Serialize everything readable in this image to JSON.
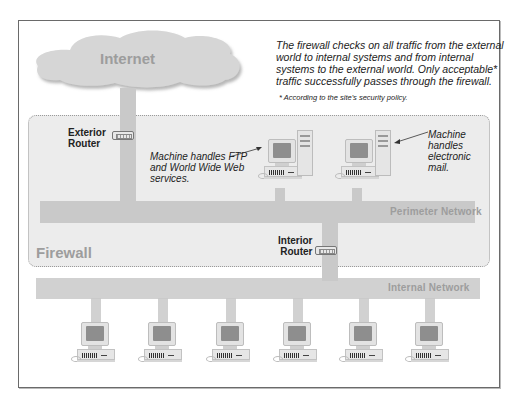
{
  "diagram": {
    "cloud_label": "Internet",
    "description": "The firewall checks on all traffic from the external world to internal systems and from internal systems to the external world. Only acceptable* traffic successfully passes through the firewall.",
    "description_lines": [
      "The firewall checks on all traffic from the external",
      "world to internal systems and from internal",
      "systems to the external world. Only acceptable*",
      "traffic successfully passes through the firewall."
    ],
    "footnote": "* According to the site's security policy.",
    "firewall_label": "Firewall",
    "exterior_router": {
      "line1": "Exterior",
      "line2": "Router"
    },
    "interior_router": {
      "line1": "Interior",
      "line2": "Router"
    },
    "perimeter_network_label": "Perimeter Network",
    "internal_network_label": "Internal Network",
    "ftp_note_lines": [
      "Machine handles FTP",
      "and World Wide Web",
      "services."
    ],
    "mail_note_lines": [
      "Machine",
      "handles",
      "electronic",
      "mail."
    ],
    "internal_host_count": 6,
    "colors": {
      "network_bar": "#c9c9c9",
      "firewall_fill": "#ececec",
      "label_gray": "#9d9d9d",
      "cloud": "#d6d6d6"
    }
  }
}
